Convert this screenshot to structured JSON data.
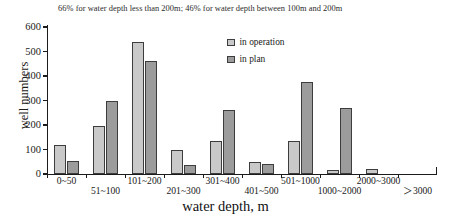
{
  "chart_data": {
    "type": "bar",
    "title": "66% for water depth less than 200m; 46% for water depth between 100m and 200m",
    "xlabel": "water depth, m",
    "ylabel": "well numbers",
    "ylim": [
      0,
      600
    ],
    "yticks": [
      0,
      100,
      200,
      300,
      400,
      500,
      600
    ],
    "grid": false,
    "legend_position": "top-center-right",
    "categories": [
      "0~50",
      "51~100",
      "101~200",
      "201~300",
      "301~400",
      "401~500",
      "501~1000",
      "1000~2000",
      "2000~3000",
      "＞3000"
    ],
    "series": [
      {
        "name": "in operation",
        "color": "#c9c9c9",
        "values": [
          120,
          195,
          540,
          100,
          135,
          50,
          135,
          15,
          20,
          0
        ]
      },
      {
        "name": "in plan",
        "color": "#9c9c9c",
        "values": [
          55,
          300,
          460,
          35,
          260,
          40,
          375,
          270,
          0,
          0
        ]
      }
    ]
  },
  "legend": {
    "items": [
      {
        "label": "in operation"
      },
      {
        "label": "in plan"
      }
    ]
  },
  "axes": {
    "y_tick_labels": [
      "0",
      "100",
      "200",
      "300",
      "400",
      "500",
      "600"
    ],
    "x_tick_labels": [
      "0~50",
      "51~100",
      "101~200",
      "201~300",
      "301~400",
      "401~500",
      "501~1000",
      "1000~2000",
      "2000~3000",
      "＞3000"
    ]
  }
}
